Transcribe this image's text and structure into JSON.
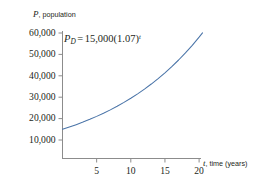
{
  "chart_data": {
    "type": "line",
    "title": "",
    "equation": {
      "lhs_var": "P",
      "lhs_sub": "D",
      "equals": "=",
      "coefficient": "15,000",
      "base": "(1.07)",
      "exponent": "t",
      "full": "P_D = 15,000(1.07)^t"
    },
    "xlabel": "t, time (years)",
    "xlabel_var": "t",
    "xlabel_rest": ", time (years)",
    "ylabel": "P, population",
    "ylabel_var": "P",
    "ylabel_rest": ", population",
    "xticks": [
      5,
      10,
      15,
      20
    ],
    "xtick_labels": [
      "5",
      "10",
      "15",
      "20"
    ],
    "yticks": [
      10000,
      20000,
      30000,
      40000,
      50000,
      60000
    ],
    "ytick_labels": [
      "10,000",
      "20,000",
      "30,000",
      "40,000",
      "50,000",
      "60,000"
    ],
    "xlim": [
      0,
      22
    ],
    "ylim": [
      0,
      62000
    ],
    "grid": false,
    "legend": false,
    "series": [
      {
        "name": "P_D = 15,000(1.07)^t",
        "color": "#4a74a8",
        "x": [
          0,
          1,
          2,
          3,
          4,
          5,
          6,
          7,
          8,
          9,
          10,
          11,
          12,
          13,
          14,
          15,
          16,
          17,
          18,
          19,
          20,
          20.5
        ],
        "values": [
          15000,
          16050,
          17174,
          18376,
          19663,
          21039,
          22511,
          24087,
          25773,
          27577,
          29509,
          31575,
          33786,
          36151,
          38681,
          41388,
          44285,
          47385,
          50702,
          54251,
          58050,
          60043
        ]
      }
    ],
    "axis_color": "#8c8c8c",
    "text_color": "#231f20"
  }
}
